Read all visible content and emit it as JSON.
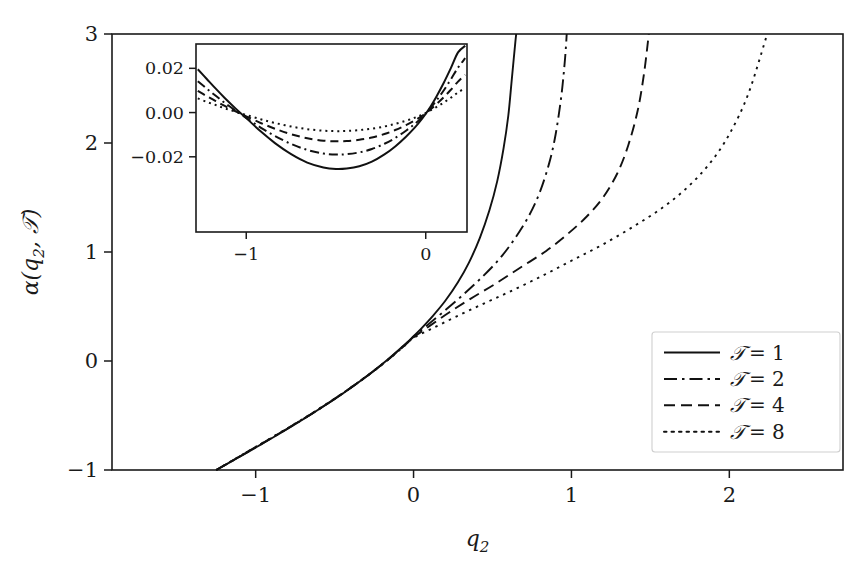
{
  "chart_data": {
    "type": "line",
    "title": "",
    "xlabel": "q₂",
    "ylabel": "α(q₂, 𝒯)",
    "xlim": [
      -1.91,
      2.72
    ],
    "ylim": [
      -1,
      3
    ],
    "xticks": [
      -1,
      0,
      1,
      2
    ],
    "xticklabels": [
      "−1",
      "0",
      "1",
      "2"
    ],
    "yticks": [
      -1,
      0,
      1,
      2,
      3
    ],
    "yticklabels": [
      "−1",
      "0",
      "1",
      "2",
      "3"
    ],
    "grid": false,
    "legend_position": "lower right",
    "series": [
      {
        "name": "𝒯 = 1",
        "label_prefix": "𝒯",
        "label_value": "= 1",
        "temperature": 1,
        "style": "solid",
        "dasharray": "none",
        "asymptote_x": 0.65,
        "x": [
          -1.25,
          -1.15,
          -1.05,
          -0.95,
          -0.85,
          -0.75,
          -0.65,
          -0.55,
          -0.45,
          -0.35,
          -0.25,
          -0.15,
          -0.05,
          0.0,
          0.05,
          0.12,
          0.2,
          0.28,
          0.35,
          0.42,
          0.48,
          0.53,
          0.57,
          0.6,
          0.62,
          0.635,
          0.645,
          0.65
        ],
        "y": [
          -1.0,
          -0.918,
          -0.836,
          -0.752,
          -0.667,
          -0.58,
          -0.49,
          -0.397,
          -0.3,
          -0.197,
          -0.088,
          0.03,
          0.158,
          0.228,
          0.3,
          0.41,
          0.55,
          0.72,
          0.9,
          1.13,
          1.38,
          1.65,
          1.95,
          2.25,
          2.55,
          2.78,
          2.93,
          3.0
        ]
      },
      {
        "name": "𝒯 = 2",
        "label_prefix": "𝒯",
        "label_value": "= 2",
        "temperature": 2,
        "style": "dashdot",
        "dasharray": "13,5,2.5,5",
        "asymptote_x": 0.97,
        "x": [
          -1.25,
          -1.15,
          -1.05,
          -0.95,
          -0.85,
          -0.75,
          -0.65,
          -0.55,
          -0.45,
          -0.35,
          -0.25,
          -0.15,
          -0.05,
          0.0,
          0.08,
          0.18,
          0.3,
          0.42,
          0.54,
          0.64,
          0.73,
          0.8,
          0.86,
          0.9,
          0.935,
          0.955,
          0.965,
          0.97
        ],
        "y": [
          -1.0,
          -0.917,
          -0.834,
          -0.75,
          -0.665,
          -0.578,
          -0.489,
          -0.396,
          -0.299,
          -0.197,
          -0.089,
          0.028,
          0.155,
          0.222,
          0.32,
          0.44,
          0.59,
          0.75,
          0.93,
          1.12,
          1.33,
          1.55,
          1.82,
          2.08,
          2.42,
          2.7,
          2.88,
          3.0
        ]
      },
      {
        "name": "𝒯 = 4",
        "label_prefix": "𝒯",
        "label_value": "= 4",
        "temperature": 4,
        "style": "dashed",
        "dasharray": "11,6",
        "asymptote_x": 1.49,
        "x": [
          -1.25,
          -1.15,
          -1.05,
          -0.95,
          -0.85,
          -0.75,
          -0.65,
          -0.55,
          -0.45,
          -0.35,
          -0.25,
          -0.15,
          -0.05,
          0.0,
          0.1,
          0.22,
          0.36,
          0.52,
          0.68,
          0.84,
          0.98,
          1.1,
          1.2,
          1.29,
          1.36,
          1.42,
          1.46,
          1.49
        ],
        "y": [
          -1.0,
          -0.916,
          -0.832,
          -0.748,
          -0.663,
          -0.576,
          -0.488,
          -0.395,
          -0.298,
          -0.196,
          -0.089,
          0.026,
          0.152,
          0.218,
          0.32,
          0.44,
          0.57,
          0.71,
          0.86,
          1.01,
          1.17,
          1.33,
          1.5,
          1.72,
          1.98,
          2.3,
          2.64,
          3.0
        ]
      },
      {
        "name": "𝒯 = 8",
        "label_prefix": "𝒯",
        "label_value": "= 8",
        "temperature": 8,
        "style": "dotted",
        "dasharray": "2.5,5",
        "asymptote_x": 2.24,
        "x": [
          -1.25,
          -1.15,
          -1.05,
          -0.95,
          -0.85,
          -0.75,
          -0.65,
          -0.55,
          -0.45,
          -0.35,
          -0.25,
          -0.15,
          -0.05,
          0.0,
          0.12,
          0.26,
          0.42,
          0.6,
          0.8,
          1.0,
          1.2,
          1.4,
          1.58,
          1.74,
          1.88,
          2.0,
          2.12,
          2.24
        ],
        "y": [
          -1.0,
          -0.915,
          -0.83,
          -0.746,
          -0.661,
          -0.574,
          -0.486,
          -0.393,
          -0.297,
          -0.195,
          -0.088,
          0.024,
          0.148,
          0.212,
          0.3,
          0.4,
          0.51,
          0.63,
          0.77,
          0.92,
          1.07,
          1.24,
          1.41,
          1.6,
          1.82,
          2.08,
          2.45,
          3.0
        ]
      }
    ],
    "inset": {
      "xlim": [
        -1.28,
        0.23
      ],
      "ylim": [
        -0.054,
        0.031
      ],
      "xticks": [
        -1,
        0
      ],
      "xticklabels": [
        "−1",
        "0"
      ],
      "yticks": [
        0.02,
        0.0,
        -0.02
      ],
      "yticklabels": [
        "0.02",
        "0.00",
        "−0.02"
      ],
      "grid": false,
      "series": [
        {
          "name": "𝒯 = 1",
          "style": "solid",
          "dasharray": "none",
          "x": [
            -1.27,
            -1.22,
            -1.17,
            -1.12,
            -1.06,
            -1.0,
            -0.92,
            -0.84,
            -0.75,
            -0.66,
            -0.57,
            -0.5,
            -0.44,
            -0.37,
            -0.3,
            -0.23,
            -0.17,
            -0.11,
            -0.06,
            -0.02,
            0.02,
            0.06,
            0.1,
            0.14,
            0.18,
            0.22
          ],
          "y": [
            0.0196,
            0.0152,
            0.0108,
            0.0066,
            0.0019,
            -0.0025,
            -0.0085,
            -0.0138,
            -0.0188,
            -0.0226,
            -0.0248,
            -0.0255,
            -0.0253,
            -0.0243,
            -0.0222,
            -0.0189,
            -0.0153,
            -0.0109,
            -0.0067,
            -0.0028,
            0.0018,
            0.0073,
            0.0134,
            0.0201,
            0.0272,
            0.0302
          ]
        },
        {
          "name": "𝒯 = 2",
          "style": "dashdot",
          "dasharray": "9,4,2,4",
          "x": [
            -1.27,
            -1.22,
            -1.17,
            -1.12,
            -1.06,
            -1.0,
            -0.92,
            -0.84,
            -0.75,
            -0.66,
            -0.57,
            -0.5,
            -0.44,
            -0.37,
            -0.3,
            -0.23,
            -0.17,
            -0.11,
            -0.06,
            -0.02,
            0.02,
            0.06,
            0.1,
            0.14,
            0.18,
            0.22
          ],
          "y": [
            0.0142,
            0.0108,
            0.0076,
            0.0044,
            0.0009,
            -0.0024,
            -0.0068,
            -0.0106,
            -0.0142,
            -0.0169,
            -0.0185,
            -0.019,
            -0.0188,
            -0.018,
            -0.0165,
            -0.0141,
            -0.0115,
            -0.0082,
            -0.0051,
            -0.0021,
            0.0014,
            0.0055,
            0.01,
            0.015,
            0.0203,
            0.0246
          ]
        },
        {
          "name": "𝒯 = 4",
          "style": "dashed",
          "dasharray": "8,5",
          "x": [
            -1.27,
            -1.22,
            -1.17,
            -1.12,
            -1.06,
            -1.0,
            -0.92,
            -0.84,
            -0.75,
            -0.66,
            -0.57,
            -0.5,
            -0.44,
            -0.37,
            -0.3,
            -0.23,
            -0.17,
            -0.11,
            -0.06,
            -0.02,
            0.02,
            0.06,
            0.1,
            0.14,
            0.18,
            0.22
          ],
          "y": [
            0.0098,
            0.0074,
            0.0052,
            0.003,
            0.0006,
            -0.0017,
            -0.0047,
            -0.0073,
            -0.0098,
            -0.0116,
            -0.0127,
            -0.013,
            -0.0129,
            -0.0123,
            -0.0113,
            -0.0097,
            -0.0079,
            -0.0057,
            -0.0035,
            -0.0015,
            0.001,
            0.0038,
            0.0069,
            0.0103,
            0.014,
            0.0171
          ]
        },
        {
          "name": "𝒯 = 8",
          "style": "dotted",
          "dasharray": "2,4",
          "x": [
            -1.27,
            -1.22,
            -1.17,
            -1.12,
            -1.06,
            -1.0,
            -0.92,
            -0.84,
            -0.75,
            -0.66,
            -0.57,
            -0.5,
            -0.44,
            -0.37,
            -0.3,
            -0.23,
            -0.17,
            -0.11,
            -0.06,
            -0.02,
            0.02,
            0.06,
            0.1,
            0.14,
            0.18,
            0.22
          ],
          "y": [
            0.0064,
            0.0048,
            0.0034,
            0.0019,
            0.0004,
            -0.0011,
            -0.003,
            -0.0047,
            -0.0063,
            -0.0075,
            -0.0082,
            -0.0084,
            -0.0083,
            -0.0079,
            -0.0073,
            -0.0063,
            -0.0051,
            -0.0037,
            -0.0023,
            -0.001,
            0.0007,
            0.0025,
            0.0045,
            0.0067,
            0.0091,
            0.0111
          ]
        }
      ]
    }
  },
  "geometry": {
    "main": {
      "left": 112,
      "right": 843,
      "top": 34,
      "bottom": 470
    },
    "inset": {
      "left": 196,
      "right": 467,
      "top": 44,
      "bottom": 232
    },
    "legend": {
      "left": 652,
      "right": 840,
      "top": 332,
      "bottom": 452
    }
  },
  "legend": {
    "entries": [
      {
        "label": "𝒯 = 1"
      },
      {
        "label": "𝒯 = 2"
      },
      {
        "label": "𝒯 = 4"
      },
      {
        "label": "𝒯 = 8"
      }
    ]
  },
  "colors": {
    "curve": "#111111",
    "axis": "#1a1a1a",
    "background": "#ffffff",
    "legend_border": "#cfcfcf"
  }
}
